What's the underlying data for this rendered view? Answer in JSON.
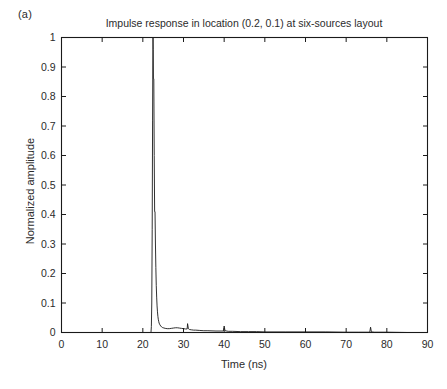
{
  "figure": {
    "panel_label": "(a)",
    "background_color": "#ffffff",
    "line_color": "#1a1a1a",
    "axis_color": "#1a1a1a"
  },
  "chart_data": {
    "type": "line",
    "title": "Impulse response in location (0.2, 0.1) at six-sources layout",
    "xlabel": "Time (ns)",
    "ylabel": "Normalized amplitude",
    "xlim": [
      0,
      90
    ],
    "ylim": [
      0,
      1
    ],
    "grid": false,
    "legend": null,
    "xticks": [
      0,
      10,
      20,
      30,
      40,
      50,
      60,
      70,
      80,
      90
    ],
    "xticklabels": [
      "0",
      "10",
      "20",
      "30",
      "40",
      "50",
      "60",
      "70",
      "80",
      "90"
    ],
    "yticks": [
      0,
      0.1,
      0.2,
      0.3,
      0.4,
      0.5,
      0.6,
      0.7,
      0.8,
      0.9,
      1
    ],
    "yticklabels": [
      "0",
      "0.1",
      "0.2",
      "0.3",
      "0.4",
      "0.5",
      "0.6",
      "0.7",
      "0.8",
      "0.9",
      "1"
    ],
    "series": [
      {
        "name": "impulse response",
        "x": [
          0,
          5,
          10,
          15,
          18,
          20,
          21,
          21.8,
          22.0,
          22.1,
          22.2,
          22.3,
          22.4,
          22.45,
          22.5,
          22.55,
          22.6,
          22.7,
          22.8,
          22.9,
          23.0,
          23.1,
          23.2,
          23.3,
          23.4,
          23.5,
          23.6,
          23.7,
          23.8,
          23.9,
          24.0,
          24.2,
          24.4,
          24.6,
          24.8,
          25.0,
          25.5,
          26.0,
          26.5,
          27.0,
          27.5,
          28.0,
          28.5,
          29.0,
          29.5,
          30.0,
          30.5,
          30.9,
          31.0,
          31.2,
          31.5,
          32.0,
          32.5,
          33.0,
          34.0,
          35.0,
          36.0,
          38.0,
          39.8,
          40.0,
          40.2,
          41.0,
          42.0,
          44.0,
          46.0,
          48.0,
          50.0,
          55.0,
          60.0,
          65.0,
          70.0,
          73.0,
          75.8,
          76.0,
          76.2,
          77.0,
          78.0,
          80.0,
          85.0,
          90.0
        ],
        "y": [
          0,
          0,
          0,
          0,
          0,
          0,
          0,
          0,
          0.0,
          0.02,
          0.1,
          0.35,
          0.72,
          0.9,
          1.0,
          0.96,
          0.86,
          0.86,
          0.6,
          0.41,
          0.41,
          0.3,
          0.22,
          0.16,
          0.12,
          0.09,
          0.07,
          0.055,
          0.045,
          0.038,
          0.032,
          0.026,
          0.022,
          0.019,
          0.017,
          0.016,
          0.014,
          0.013,
          0.013,
          0.014,
          0.015,
          0.016,
          0.016,
          0.015,
          0.014,
          0.013,
          0.012,
          0.012,
          0.03,
          0.013,
          0.01,
          0.009,
          0.008,
          0.008,
          0.007,
          0.006,
          0.006,
          0.005,
          0.005,
          0.022,
          0.006,
          0.004,
          0.004,
          0.003,
          0.003,
          0.003,
          0.002,
          0.002,
          0.002,
          0.002,
          0.001,
          0.001,
          0.001,
          0.018,
          0.002,
          0.001,
          0.001,
          0.001,
          0.0,
          0.0
        ]
      }
    ],
    "annotations": [
      {
        "label": "main impulse peak",
        "x": 22.5,
        "y": 1.0
      },
      {
        "label": "secondary shoulder",
        "x": 22.7,
        "y": 0.86
      },
      {
        "label": "tail reflection",
        "x": 31.0,
        "y": 0.03
      },
      {
        "label": "tail reflection",
        "x": 40.0,
        "y": 0.022
      },
      {
        "label": "late reflection",
        "x": 76.0,
        "y": 0.018
      }
    ]
  }
}
